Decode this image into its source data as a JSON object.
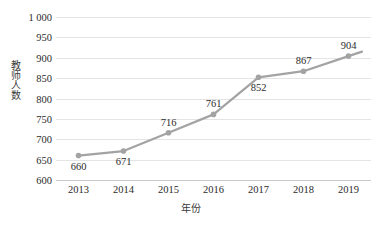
{
  "chart_data": {
    "type": "line",
    "title": "",
    "subtitle": "",
    "xlabel": "年份",
    "ylabel": "教师人数",
    "categories": [
      "2013",
      "2014",
      "2015",
      "2016",
      "2017",
      "2018",
      "2019"
    ],
    "x": [
      2013,
      2014,
      2015,
      2016,
      2017,
      2018,
      2019
    ],
    "values": [
      660,
      671,
      716,
      761,
      852,
      867,
      904
    ],
    "series": [
      {
        "name": "教师人数",
        "values": [
          660,
          671,
          716,
          761,
          852,
          867,
          904
        ],
        "color": "#a3a3a3",
        "marker": "circle",
        "line_width": 2.2
      }
    ],
    "point_labels": [
      {
        "text": "660",
        "value": 660,
        "category": "2013",
        "position": "below"
      },
      {
        "text": "671",
        "value": 671,
        "category": "2014",
        "position": "below"
      },
      {
        "text": "716",
        "value": 716,
        "category": "2015",
        "position": "above"
      },
      {
        "text": "761",
        "value": 761,
        "category": "2016",
        "position": "above"
      },
      {
        "text": "852",
        "value": 852,
        "category": "2017",
        "position": "below"
      },
      {
        "text": "867",
        "value": 867,
        "category": "2018",
        "position": "above"
      },
      {
        "text": "904",
        "value": 904,
        "category": "2019",
        "position": "above"
      }
    ],
    "ylim": [
      600,
      1000
    ],
    "ytick_values": [
      600,
      650,
      700,
      750,
      800,
      850,
      900,
      950,
      1000
    ],
    "ytick_labels": [
      "600",
      "650",
      "700",
      "750",
      "800",
      "850",
      "900",
      "950",
      "1 000"
    ],
    "grid": {
      "horizontal": true,
      "vertical": false,
      "color": "#e4e4e4"
    },
    "legend": {
      "visible": false,
      "position": "none"
    },
    "axis": {
      "bottom_line_color": "#c9c9c9",
      "left_line_visible": false
    },
    "background_color": "#ffffff",
    "text_color": "#2b2b2b"
  }
}
